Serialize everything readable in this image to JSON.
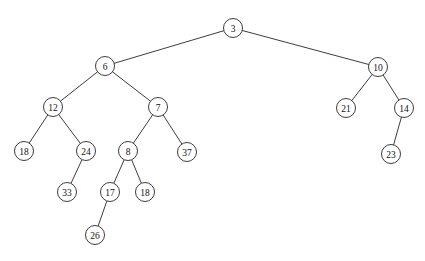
{
  "figure": {
    "caption": "Figure 12.3   Result of Unmapping minimum of 11, 8 node",
    "background_color": "#ffffff",
    "stroke_color": "#1a1a1a",
    "text_color": "#111111"
  },
  "tree": {
    "type": "binary-tree",
    "node_radius": 9.5,
    "nodes": [
      {
        "id": "n3",
        "label": "3",
        "x": 233,
        "y": 28,
        "level": 0
      },
      {
        "id": "n6",
        "label": "6",
        "x": 105,
        "y": 66,
        "level": 1
      },
      {
        "id": "n10",
        "label": "10",
        "x": 378,
        "y": 67,
        "level": 1
      },
      {
        "id": "n12",
        "label": "12",
        "x": 53,
        "y": 107,
        "level": 2
      },
      {
        "id": "n7",
        "label": "7",
        "x": 158,
        "y": 107,
        "level": 2
      },
      {
        "id": "n21",
        "label": "21",
        "x": 346,
        "y": 108,
        "level": 2
      },
      {
        "id": "n14",
        "label": "14",
        "x": 404,
        "y": 108,
        "level": 2
      },
      {
        "id": "n18a",
        "label": "18",
        "x": 24,
        "y": 151,
        "level": 3
      },
      {
        "id": "n24",
        "label": "24",
        "x": 86,
        "y": 151,
        "level": 3
      },
      {
        "id": "n8",
        "label": "8",
        "x": 128,
        "y": 151,
        "level": 3
      },
      {
        "id": "n37",
        "label": "37",
        "x": 187,
        "y": 152,
        "level": 3
      },
      {
        "id": "n23",
        "label": "23",
        "x": 391,
        "y": 154,
        "level": 3
      },
      {
        "id": "n33",
        "label": "33",
        "x": 67,
        "y": 192,
        "level": 4
      },
      {
        "id": "n17",
        "label": "17",
        "x": 110,
        "y": 192,
        "level": 4
      },
      {
        "id": "n18b",
        "label": "18",
        "x": 145,
        "y": 192,
        "level": 4
      },
      {
        "id": "n26",
        "label": "26",
        "x": 95,
        "y": 235,
        "level": 5
      }
    ],
    "edges": [
      {
        "from": "n3",
        "to": "n6",
        "side": "left"
      },
      {
        "from": "n3",
        "to": "n10",
        "side": "right"
      },
      {
        "from": "n6",
        "to": "n12",
        "side": "left"
      },
      {
        "from": "n6",
        "to": "n7",
        "side": "right"
      },
      {
        "from": "n12",
        "to": "n18a",
        "side": "left"
      },
      {
        "from": "n12",
        "to": "n24",
        "side": "right"
      },
      {
        "from": "n24",
        "to": "n33",
        "side": "right"
      },
      {
        "from": "n7",
        "to": "n8",
        "side": "left"
      },
      {
        "from": "n7",
        "to": "n37",
        "side": "right"
      },
      {
        "from": "n8",
        "to": "n17",
        "side": "left"
      },
      {
        "from": "n8",
        "to": "n18b",
        "side": "right"
      },
      {
        "from": "n17",
        "to": "n26",
        "side": "right"
      },
      {
        "from": "n10",
        "to": "n21",
        "side": "left"
      },
      {
        "from": "n10",
        "to": "n14",
        "side": "right"
      },
      {
        "from": "n14",
        "to": "n23",
        "side": "right"
      }
    ]
  }
}
